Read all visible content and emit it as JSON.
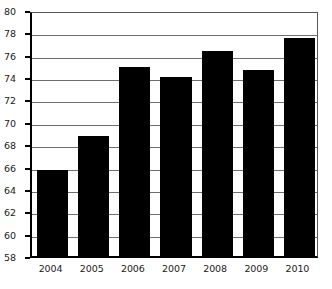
{
  "chart_data": {
    "type": "bar",
    "title": "",
    "subtitle": "",
    "xlabel": "",
    "ylabel": "",
    "categories": [
      "2004",
      "2005",
      "2006",
      "2007",
      "2008",
      "2009",
      "2010"
    ],
    "values": [
      66.0,
      69.0,
      75.2,
      74.3,
      76.6,
      74.9,
      77.8
    ],
    "series": [
      {
        "name": "",
        "values": [
          66.0,
          69.0,
          75.2,
          74.3,
          76.6,
          74.9,
          77.8
        ]
      }
    ],
    "ylim": [
      58,
      80
    ],
    "xlim": null,
    "ytick_values": [
      58,
      60,
      62,
      64,
      66,
      68,
      70,
      72,
      74,
      76,
      78,
      80
    ],
    "ytick_labels": [
      "58",
      "60",
      "62",
      "64",
      "66",
      "68",
      "70",
      "72",
      "74",
      "76",
      "78",
      "80"
    ],
    "xtick_labels": [
      "2004",
      "2005",
      "2006",
      "2007",
      "2008",
      "2009",
      "2010"
    ],
    "grid": true,
    "grid_axis": "y",
    "legend": false,
    "legend_position": "none",
    "annotations": [],
    "colors": {
      "bar_fill": "#000000",
      "gridline": "#6b6e72",
      "axis": "#000000",
      "background": "#ffffff",
      "tick_text": "#1a1a1a"
    }
  }
}
